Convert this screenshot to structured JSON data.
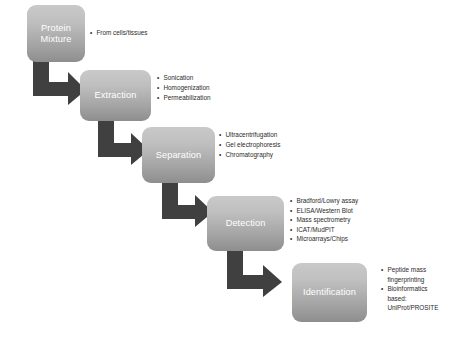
{
  "diagram": {
    "arrow_color": "#404040",
    "box_gradient_top": "#c9c9c9",
    "box_gradient_bottom": "#8e8e8e",
    "box_text_color": "#ffffff",
    "bullet_text_color": "#2b2b2b"
  },
  "stages": [
    {
      "id": "protein-mixture",
      "label": "Protein\nMixture",
      "bullets": [
        "From cells/tissues"
      ]
    },
    {
      "id": "extraction",
      "label": "Extraction",
      "bullets": [
        "Sonication",
        "Homogenization",
        "Permeabilization"
      ]
    },
    {
      "id": "separation",
      "label": "Separation",
      "bullets": [
        "Ultracentrifugation",
        "Gel electrophoresis",
        "Chromatography"
      ]
    },
    {
      "id": "detection",
      "label": "Detection",
      "bullets": [
        "Bradford/Lowry assay",
        "ELISA/Western Blot",
        "Mass spectrometry",
        "ICAT/MudPIT",
        "Microarrays/Chips"
      ]
    },
    {
      "id": "identification",
      "label": "Identification",
      "bullets": [
        "Peptide mass\nfingerprinting",
        "Bioinformatics\nbased:\nUniProt/PROSITE"
      ]
    }
  ],
  "arrows": [
    {
      "id": "arrow-mixture-to-extraction",
      "from": "protein-mixture",
      "to": "extraction"
    },
    {
      "id": "arrow-extraction-to-separation",
      "from": "extraction",
      "to": "separation"
    },
    {
      "id": "arrow-separation-to-detection",
      "from": "separation",
      "to": "detection"
    },
    {
      "id": "arrow-detection-to-identification",
      "from": "detection",
      "to": "identification"
    }
  ]
}
